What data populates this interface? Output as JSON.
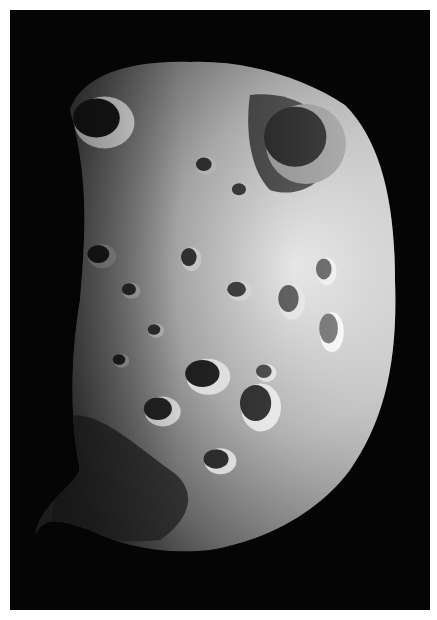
{
  "image": {
    "subject": "cratered moon",
    "description": "Grayscale photograph of a heavily cratered, irregular moon lit from the right against a black sky",
    "background_color": "#ffffff",
    "space_color": "#050505",
    "frame": {
      "x": 10,
      "y": 10,
      "width": 420,
      "height": 600
    }
  },
  "moon": {
    "outline": "M70,110 C80,80 120,60 190,62 C240,60 300,75 345,105 C380,140 395,200 395,280 C398,360 385,420 350,470 C320,510 270,540 210,550 C160,555 120,545 90,530 C60,520 45,515 35,535 C40,505 70,490 80,470 C70,420 70,360 80,300 C85,240 90,180 70,110 Z",
    "base_color": "#8a8a8a",
    "lit_color": "#e6e6e6",
    "shadow_color": "#2a2a2a",
    "craters": [
      {
        "cx": 100,
        "cy": 120,
        "rx": 30,
        "ry": 26,
        "rim": "#f0f0f0",
        "floor": "#1a1a1a"
      },
      {
        "cx": 300,
        "cy": 140,
        "rx": 40,
        "ry": 40,
        "rim": "#9a9a9a",
        "floor": "#1e1e1e"
      },
      {
        "cx": 205,
        "cy": 375,
        "rx": 22,
        "ry": 18,
        "rim": "#f2f2f2",
        "floor": "#202020"
      },
      {
        "cx": 160,
        "cy": 410,
        "rx": 18,
        "ry": 15,
        "rim": "#e8e8e8",
        "floor": "#252525"
      },
      {
        "cx": 258,
        "cy": 405,
        "rx": 20,
        "ry": 24,
        "rim": "#f4f4f4",
        "floor": "#2a2a2a"
      },
      {
        "cx": 218,
        "cy": 460,
        "rx": 16,
        "ry": 13,
        "rim": "#eeeeee",
        "floor": "#2b2b2b"
      },
      {
        "cx": 238,
        "cy": 290,
        "rx": 12,
        "ry": 10,
        "rim": "#e0e0e0",
        "floor": "#3a3a3a"
      },
      {
        "cx": 190,
        "cy": 258,
        "rx": 10,
        "ry": 12,
        "rim": "#d8d8d8",
        "floor": "#333333"
      },
      {
        "cx": 290,
        "cy": 300,
        "rx": 13,
        "ry": 18,
        "rim": "#ececec",
        "floor": "#555555"
      },
      {
        "cx": 325,
        "cy": 270,
        "rx": 10,
        "ry": 14,
        "rim": "#f0f0f0",
        "floor": "#5a5a5a"
      },
      {
        "cx": 130,
        "cy": 290,
        "rx": 9,
        "ry": 8,
        "rim": "#bbbbbb",
        "floor": "#2c2c2c"
      },
      {
        "cx": 100,
        "cy": 255,
        "rx": 14,
        "ry": 12,
        "rim": "#a0a0a0",
        "floor": "#1c1c1c"
      },
      {
        "cx": 155,
        "cy": 330,
        "rx": 8,
        "ry": 7,
        "rim": "#c8c8c8",
        "floor": "#303030"
      },
      {
        "cx": 265,
        "cy": 372,
        "rx": 10,
        "ry": 9,
        "rim": "#eeeeee",
        "floor": "#444444"
      },
      {
        "cx": 240,
        "cy": 190,
        "rx": 9,
        "ry": 8,
        "rim": "#cfcfcf",
        "floor": "#333333"
      },
      {
        "cx": 205,
        "cy": 165,
        "rx": 10,
        "ry": 9,
        "rim": "#c4c4c4",
        "floor": "#2e2e2e"
      },
      {
        "cx": 330,
        "cy": 330,
        "rx": 12,
        "ry": 20,
        "rim": "#f6f6f6",
        "floor": "#6a6a6a"
      },
      {
        "cx": 120,
        "cy": 360,
        "rx": 8,
        "ry": 7,
        "rim": "#aaaaaa",
        "floor": "#222222"
      }
    ],
    "shadow_regions": [
      "M60,420 C90,400 140,450 170,470 C200,490 190,520 160,540 C120,545 80,535 50,525 C60,490 50,450 60,420 Z",
      "M250,95 C290,90 330,110 335,150 C330,180 300,200 270,190 C250,170 245,130 250,95 Z"
    ]
  }
}
